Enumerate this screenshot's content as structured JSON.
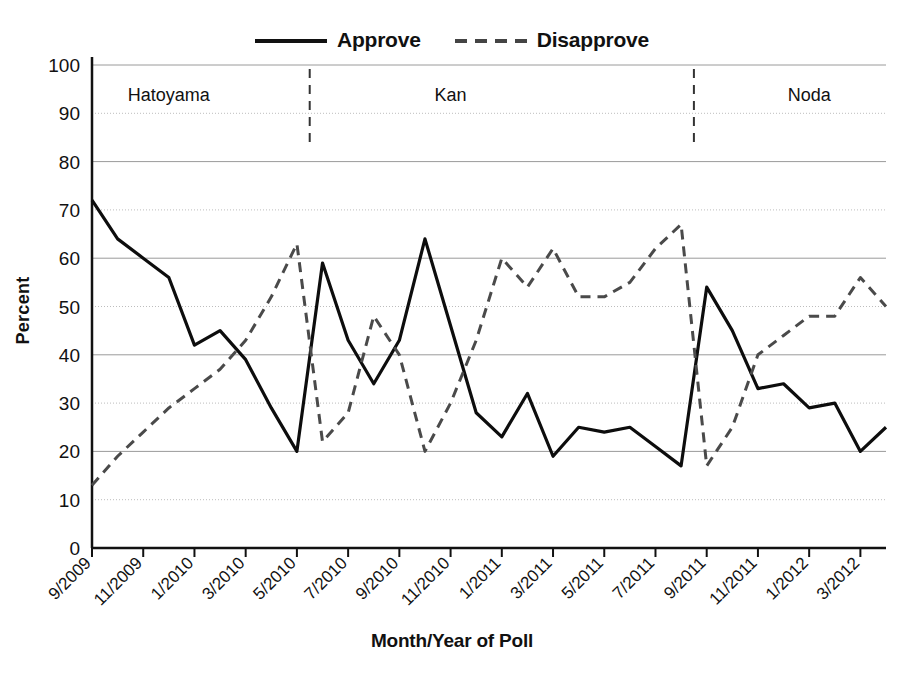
{
  "legend": {
    "items": [
      {
        "label": "Approve",
        "style": "solid",
        "icon": "solid-line-swatch"
      },
      {
        "label": "Disapprove",
        "style": "dashed",
        "icon": "dashed-line-swatch"
      }
    ]
  },
  "axes": {
    "ylabel": "Percent",
    "xlabel": "Month/Year of Poll"
  },
  "chart_data": {
    "type": "line",
    "title": "",
    "xlabel": "Month/Year of Poll",
    "ylabel": "Percent",
    "ylim": [
      0,
      100
    ],
    "ytick_step": 10,
    "yticks": [
      "0",
      "10",
      "20",
      "30",
      "40",
      "50",
      "60",
      "70",
      "80",
      "90",
      "100"
    ],
    "grid": true,
    "legend_position": "top-center",
    "x_tick_labels": [
      "9/2009",
      "11/2009",
      "1/2010",
      "3/2010",
      "5/2010",
      "7/2010",
      "9/2010",
      "11/2010",
      "1/2011",
      "3/2011",
      "5/2011",
      "7/2011",
      "9/2011",
      "11/2011",
      "1/2012",
      "3/2012"
    ],
    "x_tick_every_months": 2,
    "x": [
      "9/2009",
      "10/2009",
      "11/2009",
      "12/2009",
      "1/2010",
      "2/2010",
      "3/2010",
      "4/2010",
      "5/2010",
      "6/2010",
      "7/2010",
      "8/2010",
      "9/2010",
      "10/2010",
      "11/2010",
      "12/2010",
      "1/2011",
      "2/2011",
      "3/2011",
      "4/2011",
      "5/2011",
      "6/2011",
      "7/2011",
      "8/2011",
      "9/2011",
      "10/2011",
      "11/2011",
      "12/2011",
      "1/2012",
      "2/2012",
      "3/2012",
      "4/2012"
    ],
    "series": [
      {
        "name": "Approve",
        "style": "solid",
        "values": [
          72,
          64,
          60,
          56,
          42,
          45,
          39,
          29,
          20,
          59,
          43,
          34,
          43,
          64,
          46,
          28,
          23,
          32,
          19,
          25,
          24,
          25,
          21,
          17,
          54,
          45,
          33,
          34,
          29,
          30,
          20,
          25
        ]
      },
      {
        "name": "Disapprove",
        "style": "dashed",
        "values": [
          13,
          19,
          24,
          29,
          33,
          37,
          43,
          52,
          63,
          22,
          28,
          48,
          40,
          20,
          30,
          43,
          60,
          54,
          62,
          52,
          52,
          55,
          62,
          67,
          17,
          25,
          40,
          44,
          48,
          48,
          56,
          50
        ]
      }
    ],
    "annotations": [
      {
        "label": "Hatoyama",
        "kind": "era-label",
        "x_center": "12/2009"
      },
      {
        "label": "Kan",
        "kind": "era-label",
        "x_center": "11/2010"
      },
      {
        "label": "Noda",
        "kind": "era-label",
        "x_center": "1/2012"
      }
    ],
    "dividers": [
      {
        "kind": "vertical-dashed",
        "after": "5/2010"
      },
      {
        "kind": "vertical-dashed",
        "after": "8/2011"
      }
    ]
  }
}
